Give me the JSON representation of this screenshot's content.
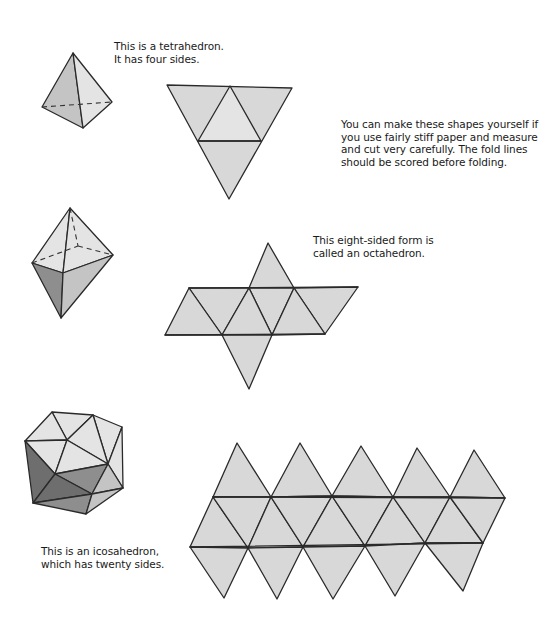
{
  "captions": {
    "tetrahedron": "This is a tetrahedron.\nIt has four sides.",
    "instructions": "You can make these shapes yourself if\nyou use fairly stiff paper and measure\nand cut very carefully. The fold lines\nshould be scored before folding.",
    "octahedron": "This eight-sided form is\ncalled an octahedron.",
    "icosahedron": "This is an icosahedron,\nwhich has twenty sides."
  },
  "shapes": [
    {
      "name": "tetrahedron",
      "faces": 4
    },
    {
      "name": "octahedron",
      "faces": 8
    },
    {
      "name": "icosahedron",
      "faces": 20
    }
  ]
}
